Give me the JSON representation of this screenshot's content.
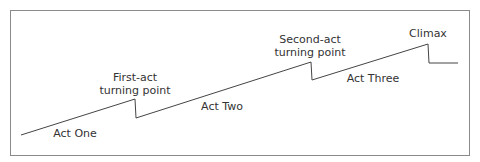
{
  "diagram": {
    "title": "",
    "line_color": "#444444",
    "frame_color": "#8a8a8a",
    "path": [
      [
        21,
        135
      ],
      [
        135,
        99
      ],
      [
        136,
        118
      ],
      [
        311,
        62
      ],
      [
        312,
        80
      ],
      [
        428,
        44
      ],
      [
        429,
        63
      ],
      [
        458,
        63
      ]
    ],
    "labels": {
      "act_one": "Act One",
      "first_turn_line1": "First-act",
      "first_turn_line2": "turning point",
      "act_two": "Act Two",
      "second_turn_line1": "Second-act",
      "second_turn_line2": "turning point",
      "act_three": "Act Three",
      "climax": "Climax"
    }
  }
}
